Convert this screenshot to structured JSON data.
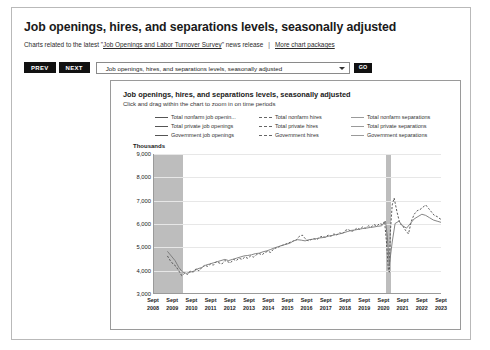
{
  "header": {
    "title": "Job openings, hires, and separations levels, seasonally adjusted",
    "blurb_pre": "Charts related to the latest \"",
    "blurb_link": "Job Openings and Labor Turnover Survey",
    "blurb_post": "\" news release",
    "separator": "|",
    "more_link": "More chart packages"
  },
  "toolbar": {
    "prev_label": "PREV",
    "next_label": "NEXT",
    "selected_option": "Job openings, hires, and separations levels, seasonally adjusted",
    "go_label": "GO"
  },
  "chart_data": {
    "type": "line",
    "title": "Job openings, hires, and separations levels, seasonally adjusted",
    "subtitle": "Click and drag within the chart to zoom in on time periods",
    "ylabel": "Thousands",
    "xlabel": "",
    "ylim": [
      3000,
      9000
    ],
    "yticks": [
      "9,000",
      "8,000",
      "7,000",
      "6,000",
      "5,000",
      "4,000",
      "3,000"
    ],
    "ytick_values": [
      9000,
      8000,
      7000,
      6000,
      5000,
      4000,
      3000
    ],
    "grid": true,
    "legend_position": "top",
    "xtick_month": "Sept",
    "xtick_years": [
      "2008",
      "2009",
      "2010",
      "2011",
      "2012",
      "2013",
      "2014",
      "2015",
      "2016",
      "2017",
      "2018",
      "2019",
      "2020",
      "2021",
      "2022",
      "2023"
    ],
    "recession_bands": [
      {
        "label": "2008-2009 recession",
        "start_year": 2008.0,
        "end_year": 2009.5
      },
      {
        "label": "2020 recession",
        "start_year": 2020.1,
        "end_year": 2020.35
      }
    ],
    "legend": [
      {
        "label": "Total nonfarm job openin...",
        "color": "#555555",
        "dash": "solid",
        "column": 0
      },
      {
        "label": "Total private job openings",
        "color": "#555555",
        "dash": "solid",
        "column": 0
      },
      {
        "label": "Government job openings",
        "color": "#555555",
        "dash": "solid",
        "column": 0
      },
      {
        "label": "Total nonfarm hires",
        "color": "#666666",
        "dash": "dashed",
        "column": 1
      },
      {
        "label": "Total private hires",
        "color": "#666666",
        "dash": "dashed",
        "column": 1
      },
      {
        "label": "Government hires",
        "color": "#666666",
        "dash": "dashed",
        "column": 1
      },
      {
        "label": "Total nonfarm separations",
        "color": "#9a9a9a",
        "dash": "solid",
        "column": 2
      },
      {
        "label": "Total private separations",
        "color": "#9a9a9a",
        "dash": "solid",
        "column": 2
      },
      {
        "label": "Government separations",
        "color": "#9a9a9a",
        "dash": "solid",
        "column": 2
      }
    ],
    "series": [
      {
        "name": "Total nonfarm hires",
        "color": "#4a4a4a",
        "dash": "dashed",
        "x": [
          2008.7,
          2008.85,
          2009.0,
          2009.15,
          2009.3,
          2009.45,
          2009.6,
          2009.75,
          2009.9,
          2010.05,
          2010.2,
          2010.35,
          2010.5,
          2010.65,
          2010.8,
          2010.95,
          2011.1,
          2011.25,
          2011.4,
          2011.55,
          2011.7,
          2011.85,
          2012.0,
          2012.15,
          2012.3,
          2012.45,
          2012.6,
          2012.75,
          2012.9,
          2013.05,
          2013.2,
          2013.35,
          2013.5,
          2013.65,
          2013.8,
          2013.95,
          2014.1,
          2014.25,
          2014.4,
          2014.55,
          2014.7,
          2014.85,
          2015.0,
          2015.15,
          2015.3,
          2015.45,
          2015.6,
          2015.75,
          2015.9,
          2016.05,
          2016.2,
          2016.35,
          2016.5,
          2016.65,
          2016.8,
          2016.95,
          2017.1,
          2017.25,
          2017.4,
          2017.55,
          2017.7,
          2017.85,
          2018.0,
          2018.15,
          2018.3,
          2018.45,
          2018.6,
          2018.75,
          2018.9,
          2019.05,
          2019.2,
          2019.35,
          2019.5,
          2019.65,
          2019.8,
          2019.95,
          2020.05,
          2020.15,
          2020.25,
          2020.3,
          2020.35,
          2020.45,
          2020.55,
          2020.7,
          2020.85,
          2021.0,
          2021.15,
          2021.3,
          2021.45,
          2021.6,
          2021.75,
          2021.9,
          2022.05,
          2022.2,
          2022.35,
          2022.5,
          2022.65,
          2022.8,
          2022.95,
          2023.1,
          2023.25,
          2023.4,
          2023.55,
          2023.7
        ],
        "y": [
          4600,
          4400,
          4250,
          4150,
          3950,
          3750,
          3850,
          3800,
          3950,
          3900,
          4050,
          3950,
          4100,
          4200,
          4150,
          4250,
          4200,
          4350,
          4300,
          4250,
          4400,
          4350,
          4300,
          4450,
          4400,
          4500,
          4450,
          4550,
          4500,
          4600,
          4550,
          4650,
          4700,
          4650,
          4750,
          4800,
          4750,
          4900,
          4950,
          5000,
          5050,
          5100,
          5150,
          5200,
          5250,
          5300,
          5450,
          5500,
          5350,
          5250,
          5300,
          5350,
          5300,
          5400,
          5450,
          5400,
          5500,
          5450,
          5550,
          5500,
          5600,
          5550,
          5700,
          5750,
          5650,
          5700,
          5800,
          5750,
          5850,
          5800,
          5900,
          5850,
          5950,
          5900,
          6000,
          5950,
          6100,
          5200,
          4000,
          3900,
          5600,
          6800,
          7100,
          6500,
          6000,
          5900,
          5700,
          5550,
          6100,
          6400,
          6550,
          6600,
          6700,
          6800,
          6650,
          6500,
          6350,
          6300,
          6200,
          6150,
          6050,
          6000,
          5850,
          5750
        ]
      },
      {
        "name": "Total nonfarm separations",
        "color": "#777777",
        "dash": "solid",
        "x": [
          2008.7,
          2008.9,
          2009.1,
          2009.3,
          2009.5,
          2009.7,
          2009.9,
          2010.1,
          2010.3,
          2010.5,
          2010.7,
          2010.9,
          2011.1,
          2011.3,
          2011.5,
          2011.7,
          2011.9,
          2012.1,
          2012.3,
          2012.5,
          2012.7,
          2012.9,
          2013.1,
          2013.3,
          2013.5,
          2013.7,
          2013.9,
          2014.1,
          2014.3,
          2014.5,
          2014.7,
          2014.9,
          2015.1,
          2015.3,
          2015.5,
          2015.7,
          2015.9,
          2016.1,
          2016.3,
          2016.5,
          2016.7,
          2016.9,
          2017.1,
          2017.3,
          2017.5,
          2017.7,
          2017.9,
          2018.1,
          2018.3,
          2018.5,
          2018.7,
          2018.9,
          2019.1,
          2019.3,
          2019.5,
          2019.7,
          2019.9,
          2020.1,
          2020.2,
          2020.3,
          2020.45,
          2020.6,
          2020.8,
          2021.0,
          2021.2,
          2021.4,
          2021.6,
          2021.8,
          2022.0,
          2022.2,
          2022.4,
          2022.6,
          2022.8,
          2023.0,
          2023.2,
          2023.4,
          2023.6,
          2023.7
        ],
        "y": [
          4800,
          4600,
          4400,
          4100,
          3900,
          3850,
          3900,
          3950,
          4050,
          4100,
          4200,
          4250,
          4300,
          4350,
          4400,
          4450,
          4400,
          4450,
          4500,
          4550,
          4600,
          4620,
          4650,
          4700,
          4720,
          4780,
          4820,
          4880,
          4950,
          5000,
          5060,
          5100,
          5150,
          5250,
          5300,
          5280,
          5250,
          5300,
          5320,
          5350,
          5380,
          5400,
          5450,
          5480,
          5520,
          5550,
          5600,
          5650,
          5700,
          5720,
          5750,
          5780,
          5800,
          5830,
          5850,
          5880,
          5900,
          6100,
          5400,
          4200,
          5200,
          6000,
          6100,
          5900,
          5800,
          6000,
          6200,
          6300,
          6400,
          6350,
          6250,
          6150,
          6100,
          6050,
          6000,
          5950,
          5880,
          5850
        ]
      }
    ]
  }
}
